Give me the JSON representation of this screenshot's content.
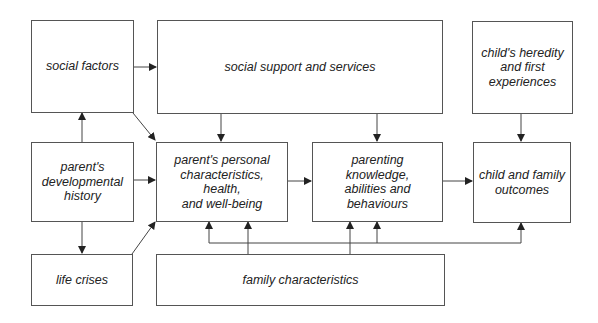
{
  "diagram": {
    "nodes": [
      {
        "id": "social-factors",
        "label": "social factors"
      },
      {
        "id": "social-support",
        "label": "social support and services"
      },
      {
        "id": "child-heredity",
        "label": "child's heredity\nand first\nexperiences"
      },
      {
        "id": "parent-dev-history",
        "label": "parent's\ndevelopmental\nhistory"
      },
      {
        "id": "parent-personal",
        "label": "parent's personal\ncharacteristics, health,\nand well-being"
      },
      {
        "id": "parenting-knowledge",
        "label": "parenting\nknowledge,\nabilities and\nbehaviours"
      },
      {
        "id": "child-outcomes",
        "label": "child and family\noutcomes"
      },
      {
        "id": "life-crises",
        "label": "life crises"
      },
      {
        "id": "family-characteristics",
        "label": "family characteristics"
      }
    ],
    "edges": [
      {
        "from": "social-factors",
        "to": "social-support"
      },
      {
        "from": "social-factors",
        "to": "parent-personal"
      },
      {
        "from": "parent-dev-history",
        "to": "social-factors"
      },
      {
        "from": "parent-dev-history",
        "to": "parent-personal"
      },
      {
        "from": "parent-dev-history",
        "to": "life-crises"
      },
      {
        "from": "life-crises",
        "to": "parent-personal"
      },
      {
        "from": "social-support",
        "to": "parent-personal"
      },
      {
        "from": "social-support",
        "to": "parenting-knowledge"
      },
      {
        "from": "child-heredity",
        "to": "child-outcomes"
      },
      {
        "from": "parent-personal",
        "to": "parenting-knowledge"
      },
      {
        "from": "parenting-knowledge",
        "to": "child-outcomes"
      },
      {
        "from": "family-characteristics",
        "to": "parent-personal"
      },
      {
        "from": "family-characteristics",
        "to": "parenting-knowledge"
      },
      {
        "from": "family-characteristics",
        "to": "parent-personal (via bus)"
      },
      {
        "from": "family-characteristics",
        "to": "parenting-knowledge (via bus)"
      },
      {
        "from": "family-characteristics",
        "to": "child-outcomes (via bus)"
      }
    ],
    "colors": {
      "line": "#333333",
      "box_border": "#555555",
      "text": "#222222",
      "background": "#ffffff"
    }
  }
}
